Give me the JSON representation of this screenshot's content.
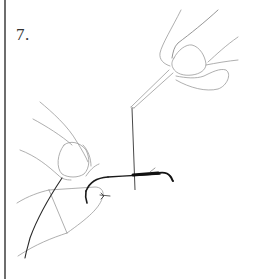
{
  "figure": {
    "step_label": "7.",
    "colors": {
      "border": "#6e6e6e",
      "text": "#333333",
      "sketch_light": "#9a9a9a",
      "sketch_dark": "#1a1a1a"
    }
  }
}
